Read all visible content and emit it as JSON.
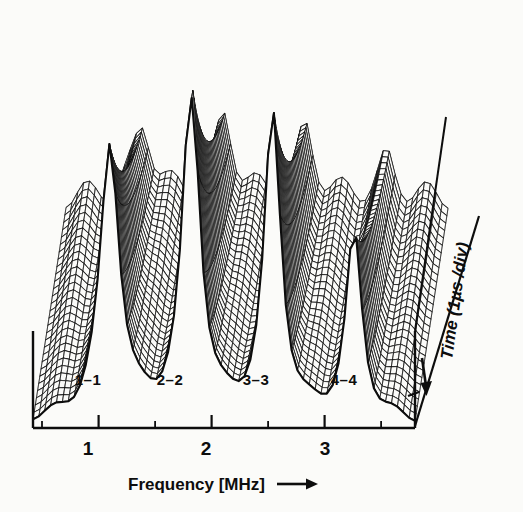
{
  "figure": {
    "type": "waterfall-3d-mesh-surface",
    "background_color": "#fbfbf9",
    "ink_color": "#0d0d0d"
  },
  "axes": {
    "x": {
      "label": "Frequency  [MHz]",
      "arrow_glyph": "→",
      "unit": "MHz",
      "tick_labels": [
        "1",
        "2",
        "3"
      ],
      "tick_values": [
        1,
        2,
        3
      ],
      "minor_ticks_per_major": 2,
      "range": [
        0.42,
        3.8
      ]
    },
    "depth": {
      "label": "Time (1µs  /div)",
      "arrow_glyph": "↓",
      "unit": "µs",
      "per_division": 1,
      "direction": "into-page-downward"
    },
    "z": {
      "label": "",
      "range": [
        0,
        1
      ]
    }
  },
  "mode_labels": [
    {
      "text": "1–1",
      "freq": 1.0
    },
    {
      "text": "2–2",
      "freq": 1.72
    },
    {
      "text": "3–3",
      "freq": 2.46
    },
    {
      "text": "4–4",
      "freq": 3.22
    }
  ],
  "chart_data": {
    "type": "line",
    "title": "",
    "subtitle": "",
    "xlabel": "Frequency [MHz]",
    "ylabel": "Time (1µs /div)",
    "zlabel": "Amplitude",
    "xlim": [
      0.42,
      3.8
    ],
    "grid": false,
    "legend": null,
    "annotations": [
      "1–1",
      "2–2",
      "3–3",
      "4–4"
    ],
    "resonances": [
      {
        "name": "1–1",
        "freq_mhz": 1.1,
        "peak_amplitude": 0.83,
        "width_mhz": 0.105,
        "decay_per_div": 0.4
      },
      {
        "name": "2–2",
        "freq_mhz": 1.82,
        "peak_amplitude": 1.0,
        "width_mhz": 0.095,
        "decay_per_div": 0.42
      },
      {
        "name": "3–3",
        "freq_mhz": 2.54,
        "peak_amplitude": 0.92,
        "width_mhz": 0.09,
        "decay_per_div": 0.45
      },
      {
        "name": "4–4",
        "freq_mhz": 3.26,
        "peak_amplitude": 0.56,
        "width_mhz": 0.085,
        "decay_per_div": 0.48
      }
    ],
    "baseline_ripple": {
      "amplitude": 0.055,
      "cycles": 9.0
    },
    "n_time_traces": 30,
    "n_freq_samples": 66,
    "time_divisions": 8
  },
  "projection": {
    "origin_front_left": [
      33,
      428
    ],
    "origin_front_right": [
      415,
      428
    ],
    "depth_dx": 33,
    "depth_dy": -218,
    "z_height": 330
  }
}
